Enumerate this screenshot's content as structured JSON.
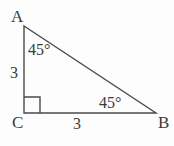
{
  "figure": {
    "type": "right-triangle-diagram",
    "background_color": "#fdfdfd",
    "stroke_color": "#4a4a4a",
    "text_color": "#3a3a3a",
    "vertices": [
      {
        "name": "A",
        "label": "A",
        "x": 24,
        "y": 26
      },
      {
        "name": "C",
        "label": "C",
        "x": 24,
        "y": 113
      },
      {
        "name": "B",
        "label": "B",
        "x": 156,
        "y": 113
      }
    ],
    "sides": [
      {
        "name": "AC",
        "label": "3"
      },
      {
        "name": "CB",
        "label": "3"
      }
    ],
    "angles": [
      {
        "at": "A",
        "label": "45°"
      },
      {
        "at": "B",
        "label": "45°"
      },
      {
        "at": "C",
        "label": "right-angle-marker"
      }
    ],
    "right_angle_marker": {
      "x": 24,
      "y": 97,
      "size": 16
    }
  }
}
